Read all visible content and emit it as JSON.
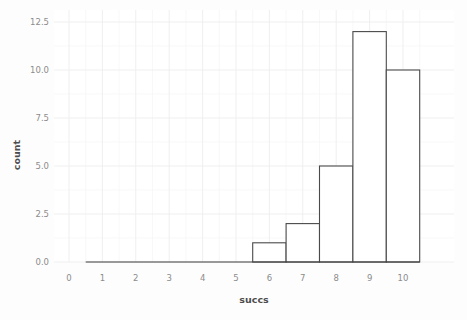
{
  "chart_data": {
    "type": "bar",
    "title": "",
    "subtitle": "",
    "xlabel": "succs",
    "ylabel": "count",
    "categories": [
      0,
      1,
      2,
      3,
      4,
      5,
      6,
      7,
      8,
      9,
      10
    ],
    "values": [
      0,
      0,
      0,
      0,
      0,
      0,
      1,
      2,
      5,
      12,
      10
    ],
    "bin_width": 1,
    "binned": true,
    "bins": [
      {
        "center": 6,
        "left": 5.5,
        "right": 6.5,
        "count": 1
      },
      {
        "center": 7,
        "left": 6.5,
        "right": 7.5,
        "count": 2
      },
      {
        "center": 8,
        "left": 7.5,
        "right": 8.5,
        "count": 5
      },
      {
        "center": 9,
        "left": 8.5,
        "right": 9.5,
        "count": 12
      },
      {
        "center": 10,
        "left": 9.5,
        "right": 10.5,
        "count": 10
      }
    ],
    "xlim": [
      -0.6,
      10.9
    ],
    "ylim": [
      0,
      13.1
    ],
    "xticks": [
      0,
      1,
      2,
      3,
      4,
      5,
      6,
      7,
      8,
      9,
      10
    ],
    "xtick_labels": [
      "0",
      "1",
      "2",
      "3",
      "4",
      "5",
      "6",
      "7",
      "8",
      "9",
      "10"
    ],
    "yticks": [
      0.0,
      2.5,
      5.0,
      7.5,
      10.0,
      12.5
    ],
    "ytick_labels": [
      "0.0",
      "2.5",
      "5.0",
      "7.5",
      "10.0",
      "12.5"
    ],
    "grid": true,
    "grid_minor": true,
    "legend": null,
    "legend_position": "none",
    "colors": {
      "bar_fill": "#ffffff",
      "bar_stroke": "#4a4a4a",
      "grid_major": "#ededed",
      "grid_minor": "#f5f5f5",
      "panel_background": "#ffffff",
      "figure_background": "#fdfdfd",
      "tick_label": "#8c8c8c",
      "axis_title": "#4d4d4d"
    }
  }
}
